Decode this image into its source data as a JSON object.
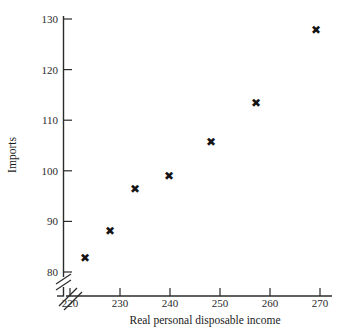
{
  "chart_data": {
    "type": "scatter",
    "title": "",
    "xlabel": "Real personal disposable income",
    "ylabel": "Imports",
    "xlim": [
      218,
      272
    ],
    "ylim": [
      78,
      131
    ],
    "xticks": [
      220,
      230,
      240,
      250,
      260,
      270
    ],
    "yticks": [
      80,
      90,
      100,
      110,
      120,
      130
    ],
    "xtick_labels": [
      "220",
      "230",
      "240",
      "250",
      "260",
      "270"
    ],
    "ytick_labels": [
      "80",
      "90",
      "100",
      "110",
      "120",
      "130"
    ],
    "grid": false,
    "legend": "none",
    "axis_break_x": true,
    "axis_break_y": true,
    "marker": "x-cross",
    "marker_glyph": "✖",
    "marker_color": "#141414",
    "series": [
      {
        "name": "Imports vs income",
        "points": [
          {
            "x": 223.0,
            "y": 82.8
          },
          {
            "x": 228.0,
            "y": 88.2
          },
          {
            "x": 233.0,
            "y": 96.4
          },
          {
            "x": 239.8,
            "y": 99.0
          },
          {
            "x": 248.2,
            "y": 105.6
          },
          {
            "x": 257.2,
            "y": 113.4
          },
          {
            "x": 269.2,
            "y": 127.8
          }
        ]
      }
    ]
  },
  "axis": {
    "x_title": "Real personal disposable income",
    "y_title": "Imports"
  },
  "labels": {
    "x": [
      "220",
      "230",
      "240",
      "250",
      "260",
      "270"
    ],
    "y": [
      "80",
      "90",
      "100",
      "110",
      "120",
      "130"
    ]
  },
  "colors": {
    "axis": "#2b2b2b",
    "marker": "#141414",
    "background": "#ffffff"
  }
}
